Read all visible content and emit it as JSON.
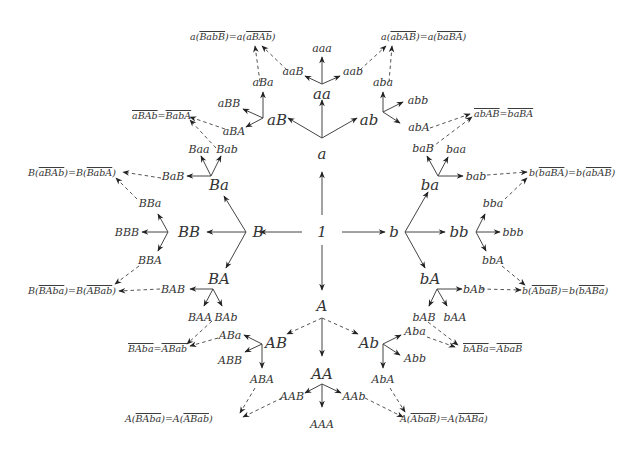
{
  "diagram": {
    "type": "Cayley graph / free group tree with reduced-word identifications",
    "root": "1",
    "generators": [
      "a",
      "b",
      "A",
      "B"
    ],
    "level1": [
      "a",
      "b",
      "A",
      "B"
    ],
    "level2": {
      "a": [
        "aa",
        "aB",
        "ab"
      ],
      "b": [
        "ba",
        "bb",
        "bA"
      ],
      "A": [
        "AA",
        "AB",
        "Ab"
      ],
      "B": [
        "Ba",
        "BB",
        "BA"
      ]
    },
    "level3": {
      "aa": [
        "aaa",
        "aaB",
        "aab"
      ],
      "aB": [
        "aBa",
        "aBB",
        "aBA"
      ],
      "ab": [
        "aba",
        "abb",
        "abA"
      ],
      "ba": [
        "baB",
        "baa",
        "bab"
      ],
      "bb": [
        "bba",
        "bbb",
        "bbA"
      ],
      "bA": [
        "bAb",
        "bAB",
        "bAA"
      ],
      "Ba": [
        "Baa",
        "Bab",
        "BaB"
      ],
      "BB": [
        "BBa",
        "BBB",
        "BBA"
      ],
      "BA": [
        "BAB",
        "BAA",
        "BAb"
      ],
      "AB": [
        "ABa",
        "ABB",
        "ABA"
      ],
      "Ab": [
        "Aba",
        "Abb",
        "AbA"
      ],
      "AA": [
        "AAB",
        "AAA",
        "AAb"
      ]
    },
    "identifications": [
      {
        "id": "top-left",
        "text": "a(BabB)=a(aBAb)",
        "lhs_prefix": "a(",
        "lhs_bar": "BabB",
        "rhs_prefix": "a(",
        "rhs_bar": "aBAb",
        "from": [
          "aBa",
          "aaB"
        ]
      },
      {
        "id": "top-right",
        "text": "a(abAB)=a(baBA)",
        "lhs_prefix": "a(",
        "lhs_bar": "abAB",
        "rhs_prefix": "a(",
        "rhs_bar": "baBA",
        "from": [
          "aab",
          "aba"
        ]
      },
      {
        "id": "upper-left",
        "text": "aBAb=BabA",
        "lhs_bar": "aBAb",
        "rhs_bar": "BabA",
        "from": [
          "aBA",
          "Bab"
        ]
      },
      {
        "id": "upper-right",
        "text": "abAB=baBA",
        "lhs_bar": "abAB",
        "rhs_bar": "baBA",
        "from": [
          "abA",
          "baB"
        ]
      },
      {
        "id": "left-upper",
        "text": "B(aBAb)=B(BabA)",
        "lhs_prefix": "B(",
        "lhs_bar": "aBAb",
        "rhs_prefix": "B(",
        "rhs_bar": "BabA",
        "from": [
          "BaB",
          "BBa"
        ]
      },
      {
        "id": "right-upper",
        "text": "b(baBA)=b(abAB)",
        "lhs_prefix": "b(",
        "lhs_bar": "baBA",
        "rhs_prefix": "b(",
        "rhs_bar": "abAB",
        "from": [
          "bab",
          "bba"
        ]
      },
      {
        "id": "left-lower",
        "text": "B(BAba)=B(ABab)",
        "lhs_prefix": "B(",
        "lhs_bar": "BAba",
        "rhs_prefix": "B(",
        "rhs_bar": "ABab",
        "from": [
          "BBA",
          "BAB"
        ]
      },
      {
        "id": "right-lower",
        "text": "b(AbaB)=b(bABa)",
        "lhs_prefix": "b(",
        "lhs_bar": "AbaB",
        "rhs_prefix": "b(",
        "rhs_bar": "bABa",
        "from": [
          "bAb",
          "bbA"
        ]
      },
      {
        "id": "lower-left",
        "text": "BAba=ABab",
        "lhs_bar": "BAba",
        "rhs_bar": "ABab",
        "from": [
          "BAb",
          "ABa"
        ]
      },
      {
        "id": "lower-right",
        "text": "bABa=AbaB",
        "lhs_bar": "bABa",
        "rhs_bar": "AbaB",
        "from": [
          "bAB",
          "Aba"
        ]
      },
      {
        "id": "bottom-left",
        "text": "A(BAba)=A(ABab)",
        "lhs_prefix": "A(",
        "lhs_bar": "BAba",
        "rhs_prefix": "A(",
        "rhs_bar": "ABab",
        "from": [
          "ABA",
          "AAB"
        ]
      },
      {
        "id": "bottom-right",
        "text": "A(AbaB)=A(bABa)",
        "lhs_prefix": "A(",
        "lhs_bar": "AbaB",
        "rhs_prefix": "A(",
        "rhs_bar": "bABa",
        "from": [
          "AAb",
          "AbA"
        ]
      }
    ],
    "edge_styles": {
      "solid": "tree edge",
      "dashed": "edge to identified word"
    },
    "colors": {
      "line": "#444444",
      "text": "#333333",
      "background": "#ffffff"
    }
  }
}
